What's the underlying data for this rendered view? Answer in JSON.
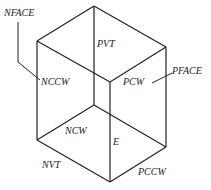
{
  "diagram": {
    "type": "isometric-box",
    "labels": {
      "nface": "NFACE",
      "nccw": "NCCW",
      "pvt": "PVT",
      "pcw": "PCW",
      "pface": "PFACE",
      "ncw": "NCW",
      "e": "E",
      "nvt": "NVT",
      "pccw": "PCCW"
    },
    "colors": {
      "line": "#222222",
      "background": "#ffffff"
    }
  }
}
